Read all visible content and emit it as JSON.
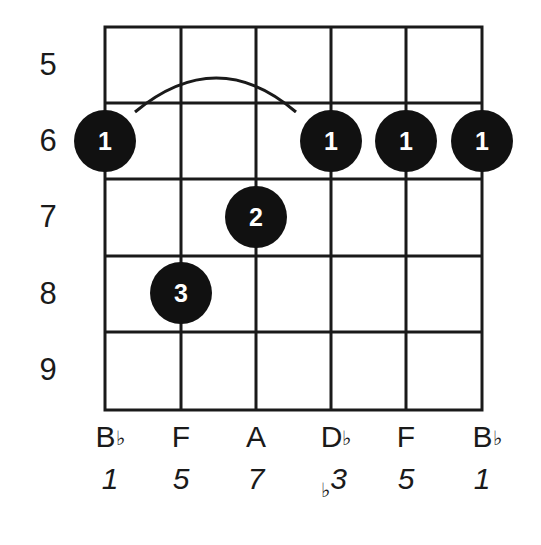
{
  "chord": {
    "root": "B♭",
    "start_fret": 5,
    "fret_labels": [
      "5",
      "6",
      "7",
      "8",
      "9"
    ],
    "strings": [
      {
        "note": "B",
        "accidental": "♭",
        "interval_accidental": "",
        "interval": "1"
      },
      {
        "note": "F",
        "accidental": "",
        "interval_accidental": "",
        "interval": "5"
      },
      {
        "note": "A",
        "accidental": "",
        "interval_accidental": "",
        "interval": "7"
      },
      {
        "note": "D",
        "accidental": "♭",
        "interval_accidental": "♭",
        "interval": "3"
      },
      {
        "note": "F",
        "accidental": "",
        "interval_accidental": "",
        "interval": "5"
      },
      {
        "note": "B",
        "accidental": "♭",
        "interval_accidental": "",
        "interval": "1"
      }
    ],
    "dots": [
      {
        "string": 1,
        "fret": 6,
        "finger": "1"
      },
      {
        "string": 2,
        "fret": 8,
        "finger": "3"
      },
      {
        "string": 3,
        "fret": 7,
        "finger": "2"
      },
      {
        "string": 4,
        "fret": 6,
        "finger": "1"
      },
      {
        "string": 5,
        "fret": 6,
        "finger": "1"
      },
      {
        "string": 6,
        "fret": 6,
        "finger": "1"
      }
    ],
    "barre": {
      "fret": 6,
      "from_string": 1,
      "to_string": 4,
      "finger": "1"
    }
  },
  "colors": {
    "line": "#1a1a1a",
    "dot": "#111111",
    "dot_text": "#ffffff",
    "background": "#ffffff"
  }
}
